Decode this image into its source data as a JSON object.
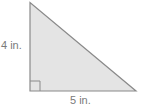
{
  "figure": {
    "shape": "right-triangle",
    "height_label": "4 in.",
    "base_label": "5 in.",
    "colors": {
      "fill": "#e4e4e4",
      "stroke": "#8a8a8a",
      "label": "#7a7a7a"
    }
  }
}
